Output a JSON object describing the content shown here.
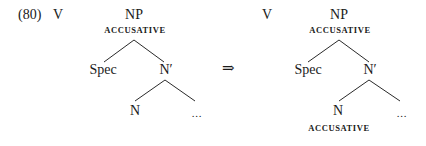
{
  "example": {
    "number": "(80)",
    "arrow": "⇒"
  },
  "trees": [
    {
      "id": "before",
      "verb": "V",
      "root": {
        "label": "NP",
        "feature": "ACCUSATIVE"
      },
      "spec": "Spec",
      "nbar": "N′",
      "head": {
        "label": "N",
        "feature": ""
      },
      "complement": ". . ."
    },
    {
      "id": "after",
      "verb": "V",
      "root": {
        "label": "NP",
        "feature": "ACCUSATIVE"
      },
      "spec": "Spec",
      "nbar": "N′",
      "head": {
        "label": "N",
        "feature": "ACCUSATIVE"
      },
      "complement": ". . ."
    }
  ]
}
